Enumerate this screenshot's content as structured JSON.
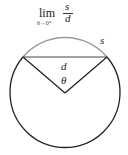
{
  "formula": {
    "operator": "lim",
    "subscript": "θ→0⁺",
    "numerator": "s",
    "denominator": "d"
  },
  "diagram": {
    "labels": {
      "arc": "s",
      "chord": "d",
      "angle": "θ"
    },
    "colors": {
      "circle": "#222222",
      "arc": "#999999",
      "chord": "#333333",
      "radii": "#222222"
    }
  }
}
